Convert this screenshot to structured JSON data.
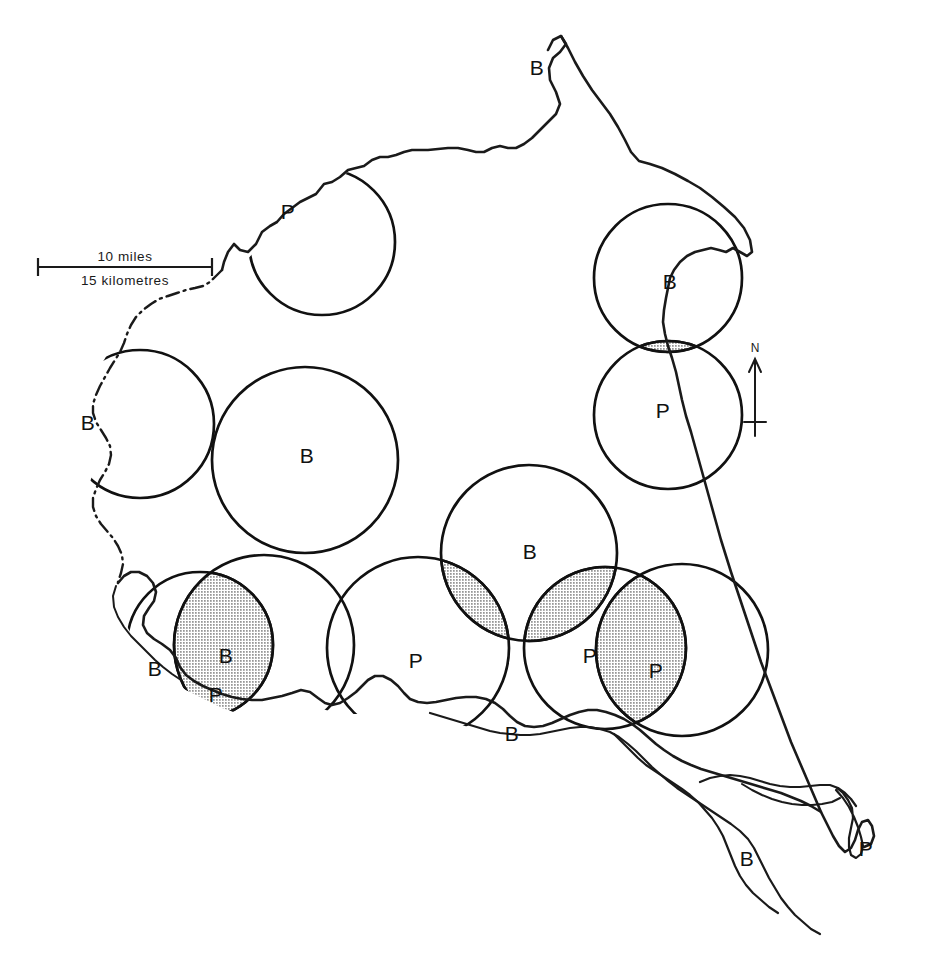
{
  "map": {
    "title": "Catchment areas map",
    "background_color": "#ffffff",
    "ink_color": "#111111",
    "stipple_color": "#111111",
    "scale_bar": {
      "primary": "10 miles",
      "secondary": "15 kilometres"
    },
    "north_arrow": {
      "label": "N"
    },
    "legend_codes": {
      "B": "B",
      "P": "P"
    },
    "labels": [
      {
        "id": "label-b-north-coast",
        "text": "B",
        "x": 537,
        "y": 69
      },
      {
        "id": "label-p-northwest",
        "text": "P",
        "x": 288,
        "y": 213
      },
      {
        "id": "label-b-northeast",
        "text": "B",
        "x": 670,
        "y": 283
      },
      {
        "id": "label-p-east",
        "text": "P",
        "x": 663,
        "y": 412
      },
      {
        "id": "label-b-west",
        "text": "B",
        "x": 88,
        "y": 424
      },
      {
        "id": "label-b-centre",
        "text": "B",
        "x": 307,
        "y": 457
      },
      {
        "id": "label-b-south-centre",
        "text": "B",
        "x": 530,
        "y": 553
      },
      {
        "id": "label-b-southwest",
        "text": "B",
        "x": 155,
        "y": 670
      },
      {
        "id": "label-b-southwest-2",
        "text": "B",
        "x": 226,
        "y": 657
      },
      {
        "id": "label-p-southwest",
        "text": "P",
        "x": 216,
        "y": 696
      },
      {
        "id": "label-p-south-centre",
        "text": "P",
        "x": 416,
        "y": 662
      },
      {
        "id": "label-p-southeast-1",
        "text": "P",
        "x": 590,
        "y": 657
      },
      {
        "id": "label-p-southeast-2",
        "text": "P",
        "x": 656,
        "y": 672
      },
      {
        "id": "label-b-south-coast",
        "text": "B",
        "x": 512,
        "y": 735
      },
      {
        "id": "label-b-southeast-est",
        "text": "B",
        "x": 747,
        "y": 860
      },
      {
        "id": "label-p-far-southeast",
        "text": "P",
        "x": 866,
        "y": 850
      }
    ],
    "circles": [
      {
        "id": "circle-northwest-p",
        "code": "P",
        "cx": 322,
        "cy": 242,
        "r": 73,
        "filled": false
      },
      {
        "id": "circle-northeast-b",
        "code": "B",
        "cx": 668,
        "cy": 278,
        "r": 74,
        "filled": false
      },
      {
        "id": "circle-east-p",
        "code": "P",
        "cx": 668,
        "cy": 415,
        "r": 74,
        "filled": false
      },
      {
        "id": "circle-west-b",
        "code": "B",
        "cx": 140,
        "cy": 424,
        "r": 74,
        "filled": false
      },
      {
        "id": "circle-centre-b",
        "code": "B",
        "cx": 305,
        "cy": 460,
        "r": 93,
        "filled": false
      },
      {
        "id": "circle-south-centre-b",
        "code": "B",
        "cx": 529,
        "cy": 553,
        "r": 88,
        "filled": false
      },
      {
        "id": "circle-southwest-a",
        "code": "B",
        "cx": 200,
        "cy": 645,
        "r": 73,
        "filled": false
      },
      {
        "id": "circle-southwest-b",
        "code": "B",
        "cx": 264,
        "cy": 645,
        "r": 90,
        "filled": false
      },
      {
        "id": "circle-south-mid",
        "code": "P",
        "cx": 418,
        "cy": 648,
        "r": 91,
        "filled": false
      },
      {
        "id": "circle-southeast-mid",
        "code": "P",
        "cx": 605,
        "cy": 648,
        "r": 81,
        "filled": false
      },
      {
        "id": "circle-southeast-far",
        "code": "P",
        "cx": 682,
        "cy": 650,
        "r": 86,
        "filled": false
      }
    ],
    "overlap_count": 6
  }
}
